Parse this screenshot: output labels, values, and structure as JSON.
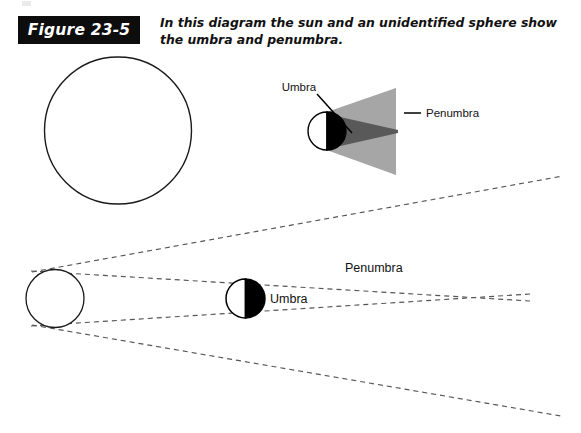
{
  "figure": {
    "badge_label": "Figure 23-5",
    "caption": "In this diagram the sun and an unidentified sphere show the umbra and penumbra.",
    "badge_bg": "#0d0d0d",
    "badge_fg": "#ffffff"
  },
  "inset_diagram": {
    "name": "umbra-penumbra-inset",
    "labels": {
      "umbra": "Umbra",
      "penumbra": "Penumbra"
    },
    "colors": {
      "penumbra_fill": "#a6a6a6",
      "umbra_fill": "#595959",
      "sphere_lit": "#ffffff",
      "sphere_dark": "#000000",
      "outline": "#000000"
    },
    "geometry": {
      "sphere_cx": 327,
      "sphere_cy": 131,
      "sphere_r": 19,
      "penumbra_apex_x": 396,
      "umbra_apex_x": 398
    }
  },
  "main_diagram": {
    "name": "sun-sphere-shadow-diagram",
    "labels": {
      "penumbra": "Penumbra",
      "umbra": "Umbra"
    },
    "colors": {
      "ray_stroke": "#555555",
      "sun_outline": "#1a1a1a",
      "sphere_dark": "#000000",
      "sphere_lit": "#ffffff"
    },
    "sun": {
      "cx": 55,
      "cy": 298,
      "r": 29
    },
    "sphere": {
      "cx": 245,
      "cy": 298,
      "r": 19
    },
    "umbra_convergence": {
      "x": 530,
      "y": 297
    },
    "rays": [
      {
        "name": "tangent-upper-outer",
        "from": [
          31,
          272
        ],
        "to": [
          562,
          177
        ]
      },
      {
        "name": "tangent-lower-outer",
        "from": [
          31,
          325
        ],
        "to": [
          560,
          415
        ]
      },
      {
        "name": "tangent-upper-inner",
        "from": [
          31,
          325
        ],
        "to": [
          530,
          294
        ]
      },
      {
        "name": "tangent-lower-inner",
        "from": [
          31,
          272
        ],
        "to": [
          530,
          300
        ]
      }
    ]
  },
  "top_large_circle": {
    "name": "sun-outline-circle",
    "cx": 118,
    "cy": 130,
    "r": 73,
    "stroke": "#1a1a1a"
  }
}
